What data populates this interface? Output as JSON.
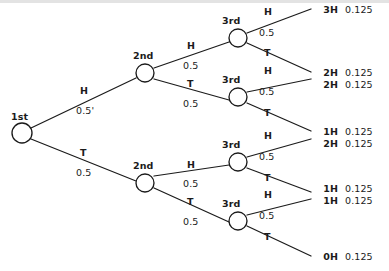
{
  "diagram": {
    "type": "probability-tree",
    "stages": [
      {
        "id": "stage1",
        "label": "1st"
      },
      {
        "id": "stage2",
        "label": "2nd"
      },
      {
        "id": "stage3",
        "label": "3rd"
      }
    ],
    "stage_labels": {
      "first": "1st",
      "second_top": "2nd",
      "second_bottom": "2nd",
      "third_1": "3rd",
      "third_2": "3rd",
      "third_3": "3rd",
      "third_4": "3rd"
    },
    "branches": {
      "b1_H_letter": "H",
      "b1_H_prob": "0.5'",
      "b1_T_letter": "T",
      "b1_T_prob": "0.5",
      "b2a_H_letter": "H",
      "b2a_H_prob": "0.5",
      "b2a_T_letter": "T",
      "b2a_T_prob": "0.5",
      "b2b_H_letter": "H",
      "b2b_H_prob": "0.5",
      "b2b_T_letter": "T",
      "b2b_T_prob": "0.5",
      "b3a_H_letter": "H",
      "b3a_H_prob": "0.5",
      "b3a_T_letter": "T",
      "b3b_H_letter": "H",
      "b3b_H_prob": "0.5",
      "b3b_T_letter": "T",
      "b3c_H_letter": "H",
      "b3c_H_prob": "0.5",
      "b3c_T_letter": "T",
      "b3d_H_letter": "H",
      "b3d_H_prob": "0.5",
      "b3d_T_letter": "T"
    },
    "outcomes": [
      {
        "count": "3H",
        "probability": "0.125"
      },
      {
        "count": "2H",
        "probability": "0.125"
      },
      {
        "count": "2H",
        "probability": "0.125"
      },
      {
        "count": "1H",
        "probability": "0.125"
      },
      {
        "count": "2H",
        "probability": "0.125"
      },
      {
        "count": "1H",
        "probability": "0.125"
      },
      {
        "count": "1H",
        "probability": "0.125"
      },
      {
        "count": "0H",
        "probability": "0.125"
      }
    ]
  }
}
